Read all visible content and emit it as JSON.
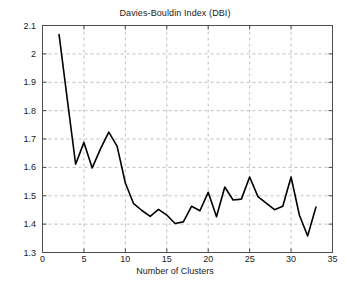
{
  "chart_data": {
    "type": "line",
    "title": "Davies-Bouldin Index (DBI)",
    "xlabel": "Number of Clusters",
    "ylabel": "",
    "xlim": [
      0,
      35
    ],
    "ylim": [
      1.3,
      2.1
    ],
    "grid": true,
    "legend": null,
    "line_color": "#000000",
    "x": [
      2,
      3,
      4,
      5,
      6,
      7,
      8,
      9,
      10,
      11,
      12,
      13,
      14,
      15,
      16,
      17,
      18,
      19,
      20,
      21,
      22,
      23,
      24,
      25,
      26,
      27,
      28,
      29,
      30,
      31,
      32,
      33
    ],
    "values": [
      2.068,
      1.838,
      1.611,
      1.688,
      1.598,
      1.665,
      1.724,
      1.675,
      1.545,
      1.472,
      1.448,
      1.427,
      1.452,
      1.432,
      1.402,
      1.408,
      1.463,
      1.447,
      1.512,
      1.426,
      1.531,
      1.485,
      1.488,
      1.566,
      1.497,
      1.474,
      1.451,
      1.463,
      1.566,
      1.432,
      1.358,
      1.46
    ],
    "xticks": [
      0,
      5,
      10,
      15,
      20,
      25,
      30,
      35
    ],
    "xtick_labels": [
      "0",
      "5",
      "10",
      "15",
      "20",
      "25",
      "30",
      "35"
    ],
    "yticks": [
      1.3,
      1.4,
      1.5,
      1.6,
      1.7,
      1.8,
      1.9,
      2.0,
      2.1
    ],
    "ytick_labels": [
      "1.3",
      "1.4",
      "1.5",
      "1.6",
      "1.7",
      "1.8",
      "1.9",
      "2",
      "2.1"
    ]
  },
  "colors": {
    "background": "#ffffff",
    "axis": "#4d4d4d",
    "grid": "#bfbfbf",
    "line": "#000000",
    "text": "#1a1a1a"
  }
}
